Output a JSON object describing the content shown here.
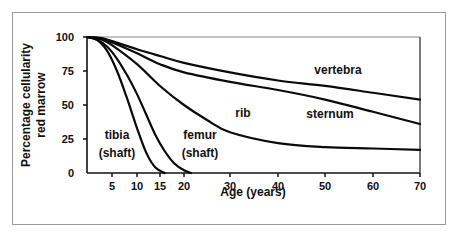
{
  "chart_data": {
    "type": "line",
    "title": "",
    "xlabel": "Age (years)",
    "ylabel": "Percentage cellularity red marrow",
    "ylabel_lines": [
      "Percentage cellularity",
      "red marrow"
    ],
    "xlim": [
      0,
      70
    ],
    "ylim": [
      0,
      100
    ],
    "grid": false,
    "legend": "inline labels",
    "x_ticks": [
      5,
      10,
      15,
      20,
      30,
      40,
      50,
      60,
      70
    ],
    "y_ticks": [
      0,
      25,
      50,
      75,
      100
    ],
    "series": [
      {
        "name": "tibia (shaft)",
        "label_lines": [
          "tibia",
          "(shaft)"
        ],
        "x": [
          0,
          2,
          4,
          6,
          8,
          10,
          12,
          14,
          16
        ],
        "y": [
          100,
          98,
          90,
          75,
          55,
          33,
          15,
          4,
          0
        ]
      },
      {
        "name": "femur (shaft)",
        "label_lines": [
          "femur",
          "(shaft)"
        ],
        "x": [
          0,
          2,
          4,
          6,
          8,
          10,
          12,
          14,
          16,
          18,
          20,
          21.5
        ],
        "y": [
          100,
          98,
          93,
          84,
          72,
          58,
          43,
          28,
          16,
          7,
          2,
          0
        ]
      },
      {
        "name": "rib",
        "label_lines": [
          "rib"
        ],
        "x": [
          0,
          3,
          5,
          10,
          15,
          20,
          25,
          30,
          40,
          50,
          60,
          70
        ],
        "y": [
          100,
          98,
          94,
          80,
          64,
          50,
          39,
          30,
          22,
          19,
          18,
          17
        ]
      },
      {
        "name": "sternum",
        "label_lines": [
          "sternum"
        ],
        "x": [
          0,
          3,
          5,
          10,
          15,
          20,
          30,
          40,
          50,
          60,
          70
        ],
        "y": [
          100,
          99,
          96,
          88,
          80,
          74,
          67,
          61,
          54,
          45,
          36
        ]
      },
      {
        "name": "vertebra",
        "label_lines": [
          "vertebra"
        ],
        "x": [
          0,
          3,
          5,
          10,
          15,
          20,
          30,
          40,
          50,
          60,
          70
        ],
        "y": [
          100,
          99,
          97,
          91,
          86,
          81,
          74,
          68,
          64,
          59,
          54
        ]
      }
    ]
  }
}
